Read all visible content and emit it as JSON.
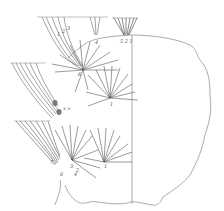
{
  "figure": {
    "stroke_color": "#777777",
    "dark_stroke_color": "#444444",
    "background": "#ffffff",
    "labels": {
      "top_1": "1",
      "top_2": "2",
      "top_3": "3",
      "top_4": "4",
      "top_right_cluster": "5 2 1",
      "center_6": "6",
      "center_1": "1",
      "bottom_7": "7",
      "bottom_3": "3",
      "bottom_2": "2",
      "bottom_1": "1",
      "bottom_6": "6",
      "bottom_4": "4",
      "small_marks": "x x"
    }
  }
}
